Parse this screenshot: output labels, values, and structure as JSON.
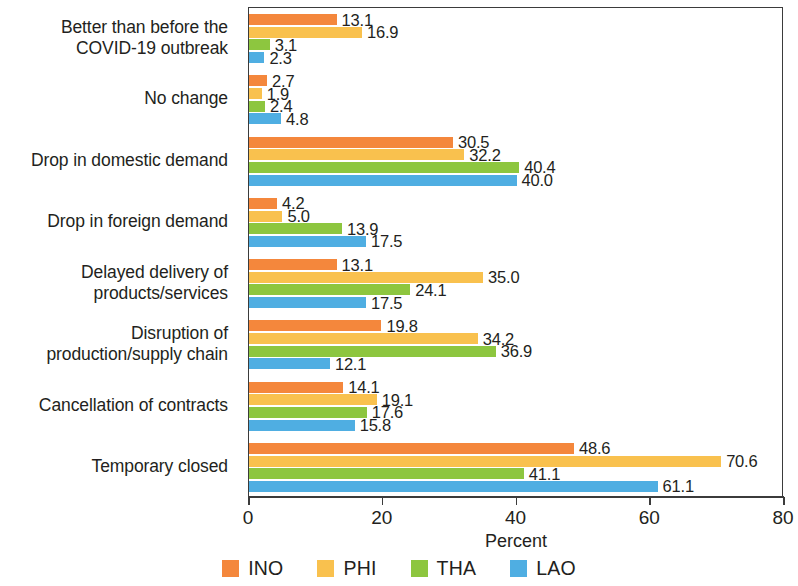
{
  "chart_data": {
    "type": "bar",
    "orientation": "horizontal",
    "title": "",
    "xlabel": "Percent",
    "ylabel": "",
    "xlim": [
      0,
      80
    ],
    "xticks": [
      0,
      20,
      40,
      60,
      80
    ],
    "grid": false,
    "legend_position": "bottom",
    "categories": [
      "Better than before the\nCOVID-19 outbreak",
      "No change",
      "Drop in domestic demand",
      "Drop in foreign demand",
      "Delayed delivery of\nproducts/services",
      "Disruption of\nproduction/supply chain",
      "Cancellation of contracts",
      "Temporary closed"
    ],
    "series": [
      {
        "name": "INO",
        "color": "#F4873C",
        "values": [
          13.1,
          2.7,
          30.5,
          4.2,
          13.1,
          19.8,
          14.1,
          48.6
        ]
      },
      {
        "name": "PHI",
        "color": "#F9C14E",
        "values": [
          16.9,
          1.9,
          32.2,
          5.0,
          35.0,
          34.2,
          19.1,
          70.6
        ]
      },
      {
        "name": "THA",
        "color": "#8DC63F",
        "values": [
          3.1,
          2.4,
          40.4,
          13.9,
          24.1,
          36.9,
          17.6,
          41.1
        ]
      },
      {
        "name": "LAO",
        "color": "#4FAEE2",
        "values": [
          2.3,
          4.8,
          40.0,
          17.5,
          17.5,
          12.1,
          15.8,
          61.1
        ]
      }
    ],
    "value_labels": [
      [
        "13.1",
        "16.9",
        "3.1",
        "2.3"
      ],
      [
        "2.7",
        "1.9",
        "2.4",
        "4.8"
      ],
      [
        "30.5",
        "32.2",
        "40.4",
        "40.0"
      ],
      [
        "4.2",
        "5.0",
        "13.9",
        "17.5"
      ],
      [
        "13.1",
        "35.0",
        "24.1",
        "17.5"
      ],
      [
        "19.8",
        "34.2",
        "36.9",
        "12.1"
      ],
      [
        "14.1",
        "19.1",
        "17.6",
        "15.8"
      ],
      [
        "48.6",
        "70.6",
        "41.1",
        "61.1"
      ]
    ],
    "tick_labels": [
      "0",
      "20",
      "40",
      "60",
      "80"
    ],
    "legend": [
      {
        "label": "INO",
        "color": "#F4873C"
      },
      {
        "label": "PHI",
        "color": "#F9C14E"
      },
      {
        "label": "THA",
        "color": "#8DC63F"
      },
      {
        "label": "LAO",
        "color": "#4FAEE2"
      }
    ],
    "axis_color": "#3b3b3b",
    "background": "#ffffff"
  }
}
